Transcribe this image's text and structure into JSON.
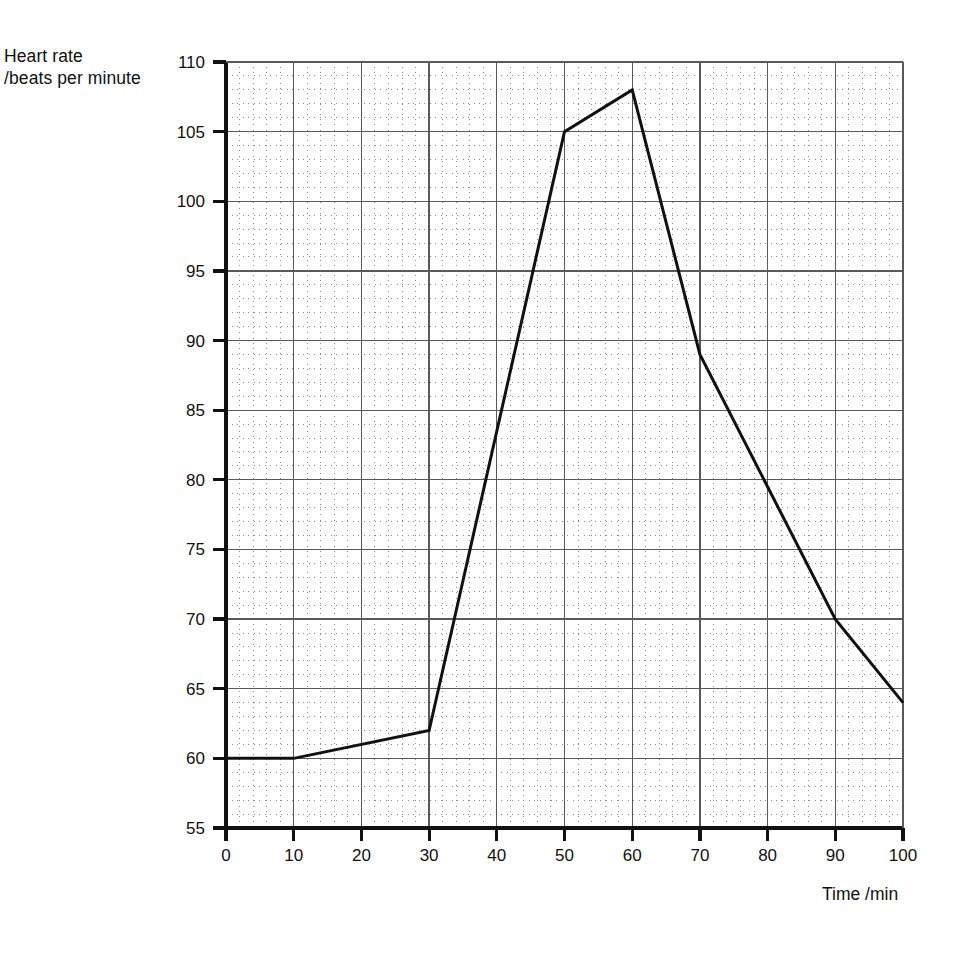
{
  "figure": {
    "name": "heart-rate-vs-time-line-graph",
    "background": "#ffffff",
    "ink": "#111111"
  },
  "labels": {
    "y_caption_line1": "Heart rate",
    "y_caption_line2": "/beats per minute",
    "x_caption": "Time /min"
  },
  "chart_data": {
    "type": "line",
    "title": "",
    "subtitle": "",
    "xlabel": "Time /min",
    "ylabel": "Heart rate /beats per minute",
    "xlim": [
      0,
      100
    ],
    "ylim": [
      55,
      110
    ],
    "x_major_step": 10,
    "y_major_step": 5,
    "x_minor_divisions": 5,
    "y_minor_divisions": 5,
    "grid": "major solid, minor dotted",
    "legend": "none",
    "xticks": [
      0,
      10,
      20,
      30,
      40,
      50,
      60,
      70,
      80,
      90,
      100
    ],
    "xtick_labels": [
      "0",
      "10",
      "20",
      "30",
      "40",
      "50",
      "60",
      "70",
      "80",
      "90",
      "100"
    ],
    "yticks": [
      55,
      60,
      65,
      70,
      75,
      80,
      85,
      90,
      95,
      100,
      105,
      110
    ],
    "ytick_labels": [
      "55",
      "60",
      "65",
      "70",
      "75",
      "80",
      "85",
      "90",
      "95",
      "100",
      "105",
      "110"
    ],
    "series": [
      {
        "name": "heart rate",
        "color": "#111111",
        "line_width": 3,
        "markers": "none",
        "x": [
          0,
          10,
          30,
          50,
          60,
          70,
          90,
          100
        ],
        "values": [
          60,
          60,
          62,
          105,
          108,
          89,
          70,
          64
        ],
        "points": [
          {
            "x": 0,
            "y": 60
          },
          {
            "x": 10,
            "y": 60
          },
          {
            "x": 30,
            "y": 62
          },
          {
            "x": 50,
            "y": 105
          },
          {
            "x": 60,
            "y": 108
          },
          {
            "x": 70,
            "y": 89
          },
          {
            "x": 90,
            "y": 70
          },
          {
            "x": 100,
            "y": 64
          }
        ]
      }
    ],
    "annotations": []
  },
  "geometry": {
    "plot_left": 226,
    "plot_right": 903,
    "plot_top": 62,
    "plot_bottom": 828
  },
  "colors": {
    "axis": "#111111",
    "major_grid": "#5a5a5a",
    "minor_grid": "#8a8a8a",
    "series": "#111111",
    "page_background": "#ffffff"
  }
}
